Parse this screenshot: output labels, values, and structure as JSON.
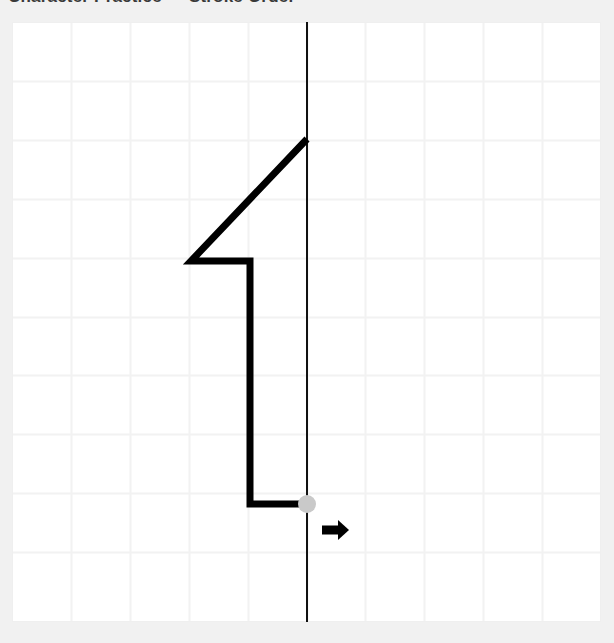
{
  "header": {
    "text": "Character Practice — Stroke Order"
  },
  "canvas": {
    "label": "grid-canvas",
    "background_color": "#ffffff",
    "page_background_color": "#f1f1f1",
    "grid_line_color": "#f2f2f2",
    "grid_border_color": "#efefef",
    "columns": 10,
    "rows": 10,
    "cell_size_px": 58.9,
    "origin_x_px": 12,
    "origin_y_px": 22,
    "width_px": 589,
    "height_px": 600
  },
  "guide_line": {
    "name": "vertical-center-guide",
    "color": "#111111",
    "width_px": 2,
    "x_px": 295,
    "y_start_px": 0,
    "y_end_px": 600
  },
  "stroke": {
    "name": "character-stroke",
    "character": "1",
    "color": "#000000",
    "width_px": 7,
    "points": [
      [
        295,
        117
      ],
      [
        179,
        239
      ],
      [
        238,
        239
      ],
      [
        238,
        482
      ],
      [
        295,
        482
      ]
    ]
  },
  "cursor_dot": {
    "name": "stroke-end-cursor",
    "color": "#c9c9c9",
    "radius_px": 9,
    "x_px": 295,
    "y_px": 482
  },
  "direction_arrow": {
    "name": "direction-arrow-right",
    "color": "#000000",
    "direction": "right",
    "shaft_x_start_px": 310,
    "shaft_x_end_px": 326,
    "shaft_y_px": 508,
    "shaft_thickness_px": 9,
    "head_x_tip_px": 337,
    "head_half_height_px": 10
  }
}
